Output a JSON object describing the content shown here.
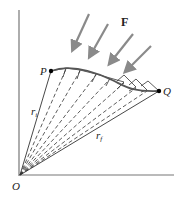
{
  "diagram": {
    "labels": {
      "force": "F",
      "start_point": "P",
      "end_point": "Q",
      "origin": "O",
      "r_start": "r",
      "r_start_sub": "i",
      "r_end": "r",
      "r_end_sub": "f"
    },
    "colors": {
      "axis": "#777777",
      "arrow": "#8a8a8a",
      "curve": "#555555",
      "lines": "#333333",
      "dot": "#000000"
    },
    "points": {
      "origin": [
        20,
        175
      ],
      "P": [
        51,
        71
      ],
      "Q": [
        159,
        91
      ]
    },
    "force_arrows": [
      {
        "from": [
          89,
          14
        ],
        "to": [
          72,
          52
        ]
      },
      {
        "from": [
          108,
          24
        ],
        "to": [
          89,
          59
        ]
      },
      {
        "from": [
          133,
          34
        ],
        "to": [
          108,
          66
        ]
      },
      {
        "from": [
          151,
          46
        ],
        "to": [
          124,
          74
        ]
      }
    ]
  }
}
